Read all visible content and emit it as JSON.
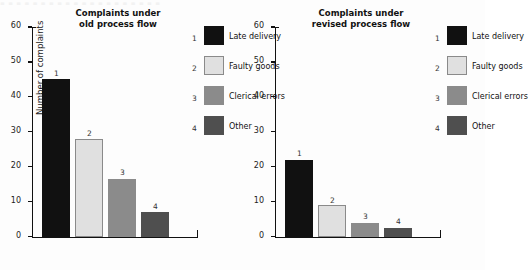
{
  "page": {
    "bleed_text": "▪ ▪ ▪ ▪ ▪ ▪ ▪ ▪ ▪ ▪ ▪ ▪ ▪ ▪ ▪ ▪ ▪ ▪ ▪ ▪"
  },
  "colors": {
    "cat1": "#111111",
    "cat2": "#e0e0e0",
    "cat2_border": "#8a8a8a",
    "cat3": "#8b8b8b",
    "cat4": "#4f4f4f",
    "axis": "#111111",
    "text": "#1a1a1a",
    "background": "#fdfdfd"
  },
  "legend": {
    "items": [
      {
        "index": "1",
        "label": "Late delivery",
        "color_key": "cat1"
      },
      {
        "index": "2",
        "label": "Faulty goods",
        "color_key": "cat2"
      },
      {
        "index": "3",
        "label": "Clerical errors",
        "color_key": "cat3"
      },
      {
        "index": "4",
        "label": "Other",
        "color_key": "cat4"
      }
    ]
  },
  "charts": {
    "left": {
      "title_line1": "Complaints under",
      "title_line2": "old process flow",
      "ylabel": "Number of complaints"
    },
    "right": {
      "title_line1": "Complaints under",
      "title_line2": "revised process flow",
      "ylabel": "Number of complaints"
    }
  },
  "chart_data": [
    {
      "type": "bar",
      "title": "Complaints under old process flow",
      "xlabel": "",
      "ylabel": "Number of complaints",
      "ylim": [
        0,
        60
      ],
      "yticks": [
        0,
        10,
        20,
        30,
        40,
        50,
        60
      ],
      "ytick_labels": [
        "0",
        "10",
        "20",
        "30",
        "40",
        "50",
        "60"
      ],
      "grid": false,
      "legend_position": "right",
      "categories": [
        "Late delivery",
        "Faulty goods",
        "Clerical errors",
        "Other"
      ],
      "point_labels": [
        "1",
        "2",
        "3",
        "4"
      ],
      "values": [
        45,
        28,
        16.5,
        7
      ],
      "colors": [
        "#111111",
        "#e0e0e0",
        "#8b8b8b",
        "#4f4f4f"
      ]
    },
    {
      "type": "bar",
      "title": "Complaints under revised process flow",
      "xlabel": "",
      "ylabel": "Number of complaints",
      "ylim": [
        0,
        60
      ],
      "yticks": [
        0,
        10,
        20,
        30,
        40,
        50,
        60
      ],
      "ytick_labels": [
        "0",
        "10",
        "20",
        "30",
        "40",
        "50",
        "60"
      ],
      "grid": false,
      "legend_position": "right",
      "categories": [
        "Late delivery",
        "Faulty goods",
        "Clerical errors",
        "Other"
      ],
      "point_labels": [
        "1",
        "2",
        "3",
        "4"
      ],
      "values": [
        22,
        9,
        4,
        2.5
      ],
      "colors": [
        "#111111",
        "#e0e0e0",
        "#8b8b8b",
        "#4f4f4f"
      ]
    }
  ]
}
